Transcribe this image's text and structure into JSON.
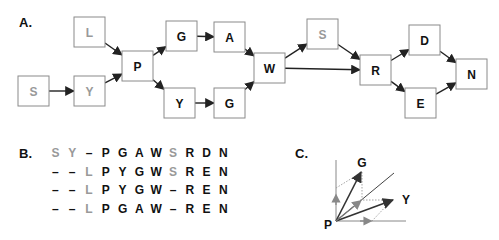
{
  "panels": {
    "a": {
      "label": "A."
    },
    "b": {
      "label": "B."
    },
    "c": {
      "label": "C."
    }
  },
  "colors": {
    "core": "#111111",
    "insert": "#999999",
    "box_border": "#8a8a8a",
    "edge": "#222222",
    "projection": "#888888"
  },
  "graph": {
    "nodes": [
      {
        "id": "S1",
        "label": "S",
        "x": 18,
        "y": 76,
        "muted": true
      },
      {
        "id": "L",
        "label": "L",
        "x": 74,
        "y": 17,
        "muted": true
      },
      {
        "id": "Y1",
        "label": "Y",
        "x": 74,
        "y": 76,
        "muted": true
      },
      {
        "id": "P",
        "label": "P",
        "x": 122,
        "y": 51,
        "muted": false
      },
      {
        "id": "G1",
        "label": "G",
        "x": 166,
        "y": 21,
        "muted": false
      },
      {
        "id": "A",
        "label": "A",
        "x": 214,
        "y": 22,
        "muted": false
      },
      {
        "id": "Y2",
        "label": "Y",
        "x": 164,
        "y": 88,
        "muted": false
      },
      {
        "id": "G2",
        "label": "G",
        "x": 214,
        "y": 88,
        "muted": false
      },
      {
        "id": "W",
        "label": "W",
        "x": 254,
        "y": 53,
        "muted": false
      },
      {
        "id": "S2",
        "label": "S",
        "x": 307,
        "y": 19,
        "muted": true
      },
      {
        "id": "R",
        "label": "R",
        "x": 360,
        "y": 55,
        "muted": false
      },
      {
        "id": "D",
        "label": "D",
        "x": 409,
        "y": 25,
        "muted": false
      },
      {
        "id": "E",
        "label": "E",
        "x": 405,
        "y": 88,
        "muted": false
      },
      {
        "id": "N",
        "label": "N",
        "x": 456,
        "y": 59,
        "muted": false
      }
    ],
    "edges": [
      [
        "S1",
        "Y1"
      ],
      [
        "L",
        "P"
      ],
      [
        "Y1",
        "P"
      ],
      [
        "P",
        "G1"
      ],
      [
        "P",
        "Y2"
      ],
      [
        "G1",
        "A"
      ],
      [
        "Y2",
        "G2"
      ],
      [
        "A",
        "W"
      ],
      [
        "G2",
        "W"
      ],
      [
        "W",
        "S2"
      ],
      [
        "W",
        "R"
      ],
      [
        "S2",
        "R"
      ],
      [
        "R",
        "D"
      ],
      [
        "R",
        "E"
      ],
      [
        "D",
        "N"
      ],
      [
        "E",
        "N"
      ]
    ]
  },
  "alignment": {
    "rows": [
      [
        {
          "c": "S",
          "m": true
        },
        {
          "c": "Y",
          "m": true
        },
        {
          "c": "–",
          "m": false
        },
        {
          "c": "P",
          "m": false
        },
        {
          "c": "G",
          "m": false
        },
        {
          "c": "A",
          "m": false
        },
        {
          "c": "W",
          "m": false
        },
        {
          "c": "S",
          "m": true
        },
        {
          "c": "R",
          "m": false
        },
        {
          "c": "D",
          "m": false
        },
        {
          "c": "N",
          "m": false
        }
      ],
      [
        {
          "c": "–",
          "m": false
        },
        {
          "c": "–",
          "m": false
        },
        {
          "c": "L",
          "m": true
        },
        {
          "c": "P",
          "m": false
        },
        {
          "c": "Y",
          "m": false
        },
        {
          "c": "G",
          "m": false
        },
        {
          "c": "W",
          "m": false
        },
        {
          "c": "S",
          "m": true
        },
        {
          "c": "R",
          "m": false
        },
        {
          "c": "E",
          "m": false
        },
        {
          "c": "N",
          "m": false
        }
      ],
      [
        {
          "c": "–",
          "m": false
        },
        {
          "c": "–",
          "m": false
        },
        {
          "c": "L",
          "m": true
        },
        {
          "c": "P",
          "m": false
        },
        {
          "c": "Y",
          "m": false
        },
        {
          "c": "G",
          "m": false
        },
        {
          "c": "W",
          "m": false
        },
        {
          "c": "–",
          "m": false
        },
        {
          "c": "R",
          "m": false
        },
        {
          "c": "E",
          "m": false
        },
        {
          "c": "N",
          "m": false
        }
      ],
      [
        {
          "c": "–",
          "m": false
        },
        {
          "c": "–",
          "m": false
        },
        {
          "c": "L",
          "m": true
        },
        {
          "c": "P",
          "m": false
        },
        {
          "c": "G",
          "m": false
        },
        {
          "c": "A",
          "m": false
        },
        {
          "c": "W",
          "m": false
        },
        {
          "c": "–",
          "m": false
        },
        {
          "c": "R",
          "m": false
        },
        {
          "c": "E",
          "m": false
        },
        {
          "c": "N",
          "m": false
        }
      ]
    ]
  },
  "vector_diagram": {
    "origin_label": "P",
    "labels": {
      "g": "G",
      "y": "Y",
      "p": "P"
    }
  }
}
